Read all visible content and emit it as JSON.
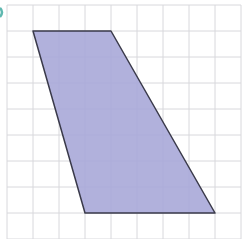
{
  "figure": {
    "type": "trapezoid-on-grid",
    "colors": {
      "background": "#ffffff",
      "grid_line": "#d8d8dc",
      "fill": "#a9a8d8",
      "stroke": "#3a3a4a",
      "corner_mark": "#5fb8b0"
    },
    "grid": {
      "origin_x": 7,
      "origin_y": 5,
      "cell": 26,
      "cols": 9,
      "rows": 9
    },
    "shape": {
      "vertices_grid": [
        [
          1,
          1
        ],
        [
          4,
          1
        ],
        [
          8,
          8
        ],
        [
          3,
          8
        ]
      ]
    }
  }
}
